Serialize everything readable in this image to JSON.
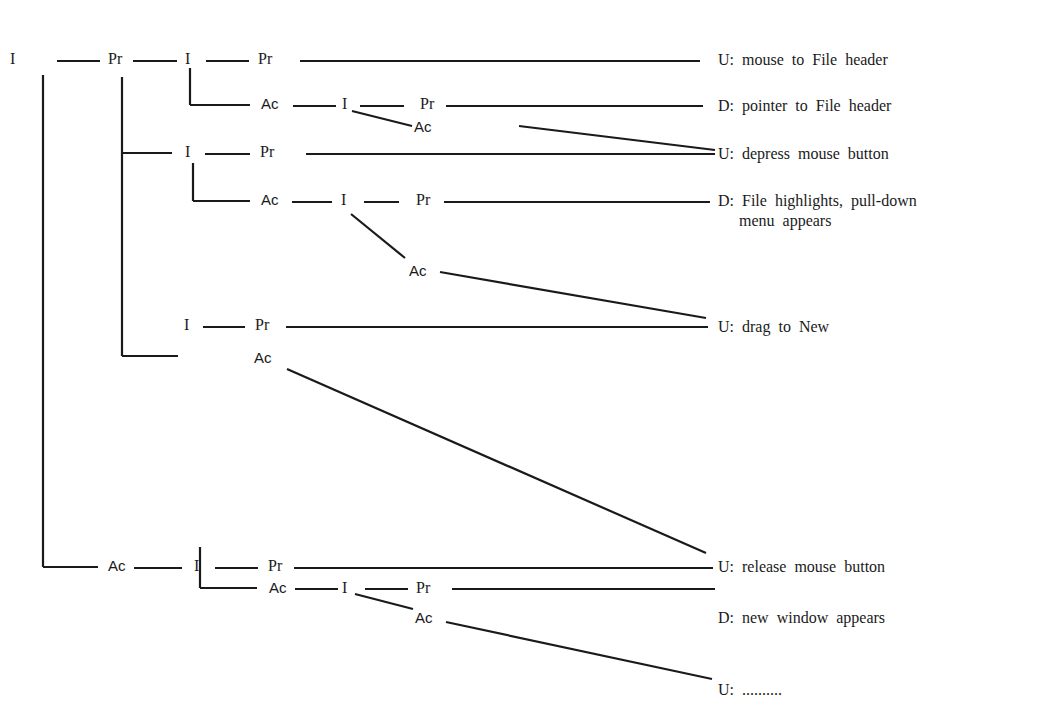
{
  "diagram": {
    "type": "interaction-grammar-tree",
    "node_labels": {
      "intention": "I",
      "presentation": "Pr",
      "action": "Ac"
    },
    "nodes": [
      {
        "id": "n1",
        "label": "I",
        "x": 10,
        "y": 51
      },
      {
        "id": "n2",
        "label": "Pr",
        "x": 108,
        "y": 51
      },
      {
        "id": "n3",
        "label": "I",
        "x": 185,
        "y": 51
      },
      {
        "id": "n4",
        "label": "Pr",
        "x": 258,
        "y": 51
      },
      {
        "id": "n5",
        "label": "Ac",
        "x": 261,
        "y": 96
      },
      {
        "id": "n6",
        "label": "I",
        "x": 342,
        "y": 96
      },
      {
        "id": "n7",
        "label": "Pr",
        "x": 420,
        "y": 96
      },
      {
        "id": "n8",
        "label": "Ac",
        "x": 414,
        "y": 119
      },
      {
        "id": "n9",
        "label": "I",
        "x": 185,
        "y": 144
      },
      {
        "id": "n10",
        "label": "Pr",
        "x": 260,
        "y": 144
      },
      {
        "id": "n11",
        "label": "Ac",
        "x": 261,
        "y": 192
      },
      {
        "id": "n12",
        "label": "I",
        "x": 341,
        "y": 192
      },
      {
        "id": "n13",
        "label": "Pr",
        "x": 416,
        "y": 192
      },
      {
        "id": "n14",
        "label": "Ac",
        "x": 409,
        "y": 263
      },
      {
        "id": "n15",
        "label": "I",
        "x": 184,
        "y": 317
      },
      {
        "id": "n16",
        "label": "Pr",
        "x": 255,
        "y": 317
      },
      {
        "id": "n17",
        "label": "Ac",
        "x": 254,
        "y": 350
      },
      {
        "id": "n18",
        "label": "Ac",
        "x": 108,
        "y": 558
      },
      {
        "id": "n19",
        "label": "I",
        "x": 194,
        "y": 558
      },
      {
        "id": "n20",
        "label": "Pr",
        "x": 268,
        "y": 558
      },
      {
        "id": "n21",
        "label": "Ac",
        "x": 269,
        "y": 580
      },
      {
        "id": "n22",
        "label": "I",
        "x": 342,
        "y": 580
      },
      {
        "id": "n23",
        "label": "Pr",
        "x": 416,
        "y": 580
      },
      {
        "id": "n24",
        "label": "Ac",
        "x": 415,
        "y": 610
      }
    ],
    "events": [
      {
        "actor": "U",
        "text": "mouse to File header",
        "x": 718,
        "y": 50
      },
      {
        "actor": "D",
        "text": "pointer to File header",
        "x": 718,
        "y": 96
      },
      {
        "actor": "U",
        "text": "depress mouse button",
        "x": 718,
        "y": 144
      },
      {
        "actor": "D",
        "text": "File highlights, pull-down",
        "continuation": "menu appears",
        "x": 718,
        "y": 191
      },
      {
        "actor": "U",
        "text": "drag to New",
        "x": 718,
        "y": 317
      },
      {
        "actor": "U",
        "text": "release mouse button",
        "x": 718,
        "y": 557
      },
      {
        "actor": "D",
        "text": "new window appears",
        "x": 718,
        "y": 608
      },
      {
        "actor": "U",
        "text": "..........",
        "x": 718,
        "y": 680
      }
    ],
    "edges": [
      [
        57,
        61,
        100,
        61
      ],
      [
        133,
        61,
        177,
        61
      ],
      [
        206,
        61,
        249,
        61
      ],
      [
        300,
        61,
        700,
        61
      ],
      [
        43,
        75,
        43,
        567
      ],
      [
        43,
        567,
        98,
        567
      ],
      [
        122,
        77,
        122,
        356
      ],
      [
        122,
        153,
        172,
        153
      ],
      [
        122,
        356,
        178,
        356
      ],
      [
        190,
        68,
        190,
        105
      ],
      [
        190,
        105,
        250,
        105
      ],
      [
        293,
        106,
        336,
        106
      ],
      [
        360,
        106,
        404,
        106
      ],
      [
        446,
        106,
        703,
        106
      ],
      [
        352,
        111,
        412,
        126
      ],
      [
        519,
        126,
        715,
        150
      ],
      [
        205,
        154,
        250,
        154
      ],
      [
        306,
        154,
        715,
        154
      ],
      [
        193,
        163,
        193,
        201
      ],
      [
        193,
        201,
        250,
        201
      ],
      [
        292,
        202,
        332,
        202
      ],
      [
        364,
        202,
        399,
        202
      ],
      [
        444,
        202,
        710,
        202
      ],
      [
        351,
        214,
        405,
        258
      ],
      [
        440,
        272,
        706,
        318
      ],
      [
        203,
        327,
        245,
        327
      ],
      [
        286,
        327,
        708,
        327
      ],
      [
        287,
        369,
        706,
        553
      ],
      [
        134,
        568,
        182,
        568
      ],
      [
        215,
        568,
        258,
        568
      ],
      [
        294,
        568,
        713,
        568
      ],
      [
        200,
        547,
        200,
        588
      ],
      [
        200,
        588,
        257,
        588
      ],
      [
        295,
        589,
        338,
        589
      ],
      [
        365,
        589,
        408,
        589
      ],
      [
        452,
        589,
        715,
        589
      ],
      [
        355,
        594,
        413,
        609
      ],
      [
        446,
        622,
        712,
        679
      ]
    ]
  }
}
